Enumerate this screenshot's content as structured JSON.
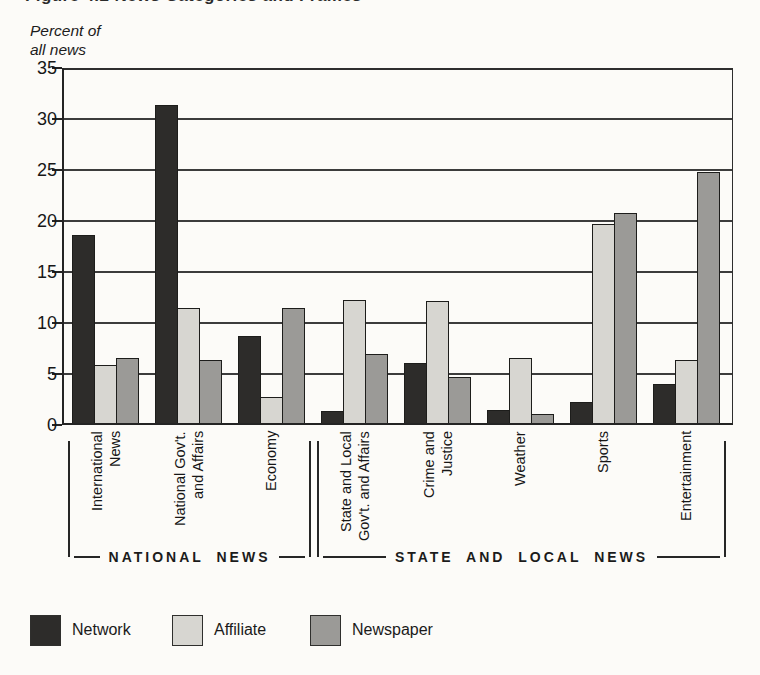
{
  "page": {
    "cropped_top_title": "Figure 4.2  News Categories and Frames",
    "background": "#fcfbf8"
  },
  "y_axis": {
    "unit_label_line1": "Percent of",
    "unit_label_line2": "all news",
    "tick_values": [
      35,
      30,
      25,
      20,
      15,
      10,
      5,
      0
    ]
  },
  "chart_data": {
    "type": "bar",
    "ylabel": "Percent of all news",
    "ylim": [
      0,
      35
    ],
    "ytick_interval": 5,
    "grid": true,
    "legend_position": "bottom",
    "categories": [
      "International News",
      "National Gov't. and Affairs",
      "Economy",
      "State and Local Gov't. and Affairs",
      "Crime and Justice",
      "Weather",
      "Sports",
      "Entertainment"
    ],
    "category_label_lines": [
      [
        "International",
        "News"
      ],
      [
        "National Gov't.",
        "and Affairs"
      ],
      [
        "Economy"
      ],
      [
        "State and Local",
        "Gov't. and Affairs"
      ],
      [
        "Crime and",
        "Justice"
      ],
      [
        "Weather"
      ],
      [
        "Sports"
      ],
      [
        "Entertainment"
      ]
    ],
    "series": [
      {
        "name": "Network",
        "color": "#2d2c2a",
        "values": [
          18.6,
          31.4,
          8.7,
          1.4,
          6.1,
          1.5,
          2.3,
          4.0
        ]
      },
      {
        "name": "Affiliate",
        "color": "#d7d6d1",
        "values": [
          5.9,
          11.5,
          2.7,
          12.3,
          12.2,
          6.6,
          19.7,
          6.4
        ]
      },
      {
        "name": "Newspaper",
        "color": "#9b9a97",
        "values": [
          6.6,
          6.4,
          11.5,
          7.0,
          4.7,
          1.1,
          20.8,
          24.8
        ]
      }
    ],
    "group_brackets": [
      {
        "label": "NATIONAL NEWS",
        "from_category": 0,
        "to_category": 2
      },
      {
        "label": "STATE AND LOCAL NEWS",
        "from_category": 3,
        "to_category": 7
      }
    ]
  },
  "legend": {
    "items": [
      {
        "label": "Network",
        "color": "#2d2c2a"
      },
      {
        "label": "Affiliate",
        "color": "#d7d6d1"
      },
      {
        "label": "Newspaper",
        "color": "#9b9a97"
      }
    ]
  }
}
